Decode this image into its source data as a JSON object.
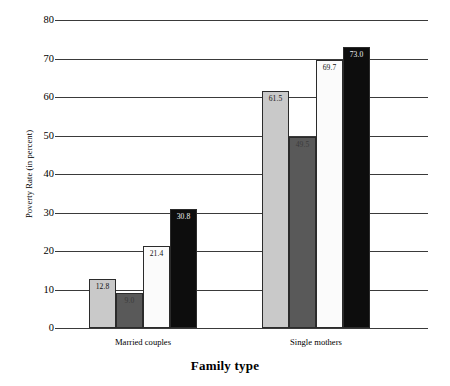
{
  "chart_data": {
    "type": "bar",
    "title": "",
    "xlabel": "Family type",
    "ylabel": "Poverty Rate (in percent)",
    "ylim": [
      0,
      80
    ],
    "ytick_labels": [
      "0",
      "10",
      "20",
      "30",
      "40",
      "50",
      "60",
      "70",
      "80"
    ],
    "ytick_values": [
      0,
      10,
      20,
      30,
      40,
      50,
      60,
      70,
      80
    ],
    "grid": true,
    "legend": "none",
    "categories": [
      "Married couples",
      "Single mothers"
    ],
    "series": [
      {
        "name": "series-1",
        "style": "lightgray",
        "color": "#c9c9c9",
        "values": [
          12.8,
          61.5
        ],
        "labels": [
          "12.8",
          "61.5"
        ]
      },
      {
        "name": "series-2",
        "style": "darkgray",
        "color": "#595959",
        "values": [
          9.0,
          49.5
        ],
        "labels": [
          "9.0",
          "49.5"
        ]
      },
      {
        "name": "series-3",
        "style": "white",
        "color": "#fbfbfb",
        "values": [
          21.4,
          69.7
        ],
        "labels": [
          "21.4",
          "69.7"
        ]
      },
      {
        "name": "series-4",
        "style": "black",
        "color": "#0d0d0d",
        "values": [
          30.8,
          73.0
        ],
        "labels": [
          "30.8",
          "73.0"
        ]
      }
    ],
    "bars": [
      {
        "group": "Married couples",
        "series": "series-1",
        "style": "lightgray",
        "value": 12.8,
        "label": "12.8"
      },
      {
        "group": "Married couples",
        "series": "series-2",
        "style": "darkgray",
        "value": 9.0,
        "label": "9.0"
      },
      {
        "group": "Married couples",
        "series": "series-3",
        "style": "white",
        "value": 21.4,
        "label": "21.4"
      },
      {
        "group": "Married couples",
        "series": "series-4",
        "style": "black",
        "value": 30.8,
        "label": "30.8"
      },
      {
        "group": "Single mothers",
        "series": "series-1",
        "style": "lightgray",
        "value": 61.5,
        "label": "61.5"
      },
      {
        "group": "Single mothers",
        "series": "series-2",
        "style": "darkgray",
        "value": 49.5,
        "label": "49.5"
      },
      {
        "group": "Single mothers",
        "series": "series-3",
        "style": "white",
        "value": 69.7,
        "label": "69.7"
      },
      {
        "group": "Single mothers",
        "series": "series-4",
        "style": "black",
        "value": 73.0,
        "label": "73.0"
      }
    ],
    "colors": {
      "series_1": "#c9c9c9",
      "series_2": "#595959",
      "series_3": "#fbfbfb",
      "series_4": "#0d0d0d",
      "gridline": "#3a3a3a",
      "bar_outline": "#2b2b2b",
      "background": "#ffffff"
    }
  }
}
